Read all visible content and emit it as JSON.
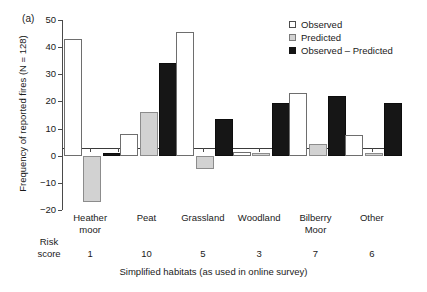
{
  "figure": {
    "panel_label": "(a)",
    "background": "#ffffff"
  },
  "chart_data": {
    "type": "bar",
    "title": "",
    "panel": "(a)",
    "categories": [
      "Heather moor",
      "Peat",
      "Grassland",
      "Woodland",
      "Bilberry Moor",
      "Other"
    ],
    "category_lines": [
      [
        "Heather",
        "moor"
      ],
      [
        "Peat",
        ""
      ],
      [
        "Grassland",
        ""
      ],
      [
        "Woodland",
        ""
      ],
      [
        "Bilberry",
        "Moor"
      ],
      [
        "Other",
        ""
      ]
    ],
    "series": [
      {
        "name": "Observed",
        "color": "#ffffff",
        "values": [
          43,
          8,
          45.5,
          1.5,
          23,
          7.5
        ]
      },
      {
        "name": "Predicted",
        "color": "#d2d2d2",
        "values": [
          -17,
          16,
          -5,
          1,
          4.5,
          1
        ]
      },
      {
        "name": "Observed – Predicted",
        "color": "#161616",
        "values": [
          1,
          34,
          13.5,
          19.5,
          22,
          19.5
        ]
      }
    ],
    "xlabel": "Simplified habitats (as used in online survey)",
    "ylabel": "Frequency of reported fires (N = 128)",
    "ylim": [
      -20,
      50
    ],
    "yticks": [
      50,
      40,
      30,
      20,
      10,
      0,
      -10,
      -20
    ],
    "ytick_labels": [
      "50",
      "40",
      "30",
      "20",
      "10",
      "0",
      "−10",
      "−20"
    ],
    "grid": false,
    "legend_position": "top-right",
    "legend_entries": [
      "Observed",
      "Predicted",
      "Observed – Predicted"
    ],
    "annotations": {
      "risk_score_label_line1": "Risk",
      "risk_score_label_line2": "score",
      "risk_scores": [
        "1",
        "10",
        "5",
        "3",
        "7",
        "6"
      ]
    }
  }
}
